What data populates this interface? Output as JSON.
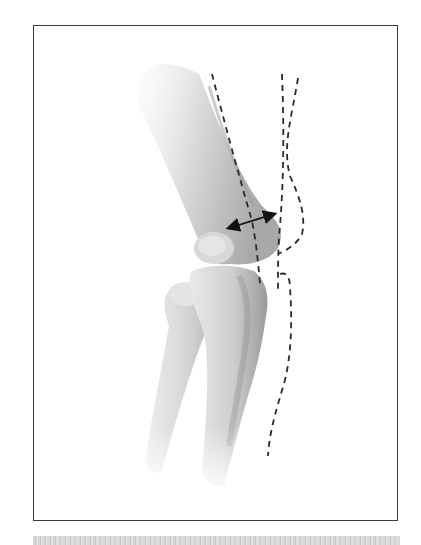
{
  "figure": {
    "caption": "",
    "colors": {
      "frame_border": "#3a3a3a",
      "bone_shade_dark": "#8a8a8a",
      "bone_shade_light": "#e6e6e6",
      "dash_line": "#2a2a2a",
      "arrow": "#111111",
      "footer_bar": "#d2d2d2"
    },
    "annotations": [
      {
        "type": "double-arrow",
        "description": "width measurement across distal humerus / capitellum"
      },
      {
        "type": "dashed-line",
        "description": "anterior humeral line along front cortex of humerus"
      },
      {
        "type": "dashed-line",
        "description": "vertical reference line crossing joint"
      },
      {
        "type": "dashed-line",
        "description": "curved posterior contour line around olecranon and ulna"
      }
    ]
  }
}
